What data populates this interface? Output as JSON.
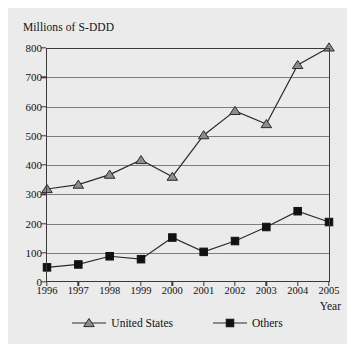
{
  "chart_data": {
    "type": "line",
    "title": "Millions of S-DDD",
    "xlabel": "Year",
    "ylabel": "Millions of S-DDD",
    "categories": [
      "1996",
      "1997",
      "1998",
      "1999",
      "2000",
      "2001",
      "2002",
      "2003",
      "2004",
      "2005"
    ],
    "series": [
      {
        "name": "United States",
        "marker": "triangle",
        "color": "#8c8c8c",
        "values": [
          318,
          333,
          367,
          417,
          360,
          502,
          585,
          540,
          742,
          802
        ]
      },
      {
        "name": "Others",
        "marker": "square",
        "color": "#111111",
        "values": [
          50,
          60,
          88,
          78,
          152,
          103,
          140,
          188,
          242,
          205
        ]
      }
    ],
    "ylim": [
      0,
      800
    ],
    "y_ticks": [
      "0",
      "100",
      "200",
      "300",
      "400",
      "500",
      "600",
      "700",
      "800"
    ],
    "grid": true,
    "legend_position": "bottom"
  },
  "axes": {
    "y_title": "Millions of S-DDD",
    "x_title": "Year"
  },
  "legend": {
    "items": [
      {
        "label": "United States",
        "icon": "triangle-marker-icon"
      },
      {
        "label": "Others",
        "icon": "square-marker-icon"
      }
    ]
  },
  "colors": {
    "plate": "#ebebeb",
    "frame": "#3a3a3a",
    "gridline": "#7d7d7d",
    "us_marker_fill": "#8c8c8c",
    "us_line": "#2b2b2b",
    "others_marker_fill": "#111111",
    "others_line": "#2b2b2b",
    "text": "#111111"
  }
}
